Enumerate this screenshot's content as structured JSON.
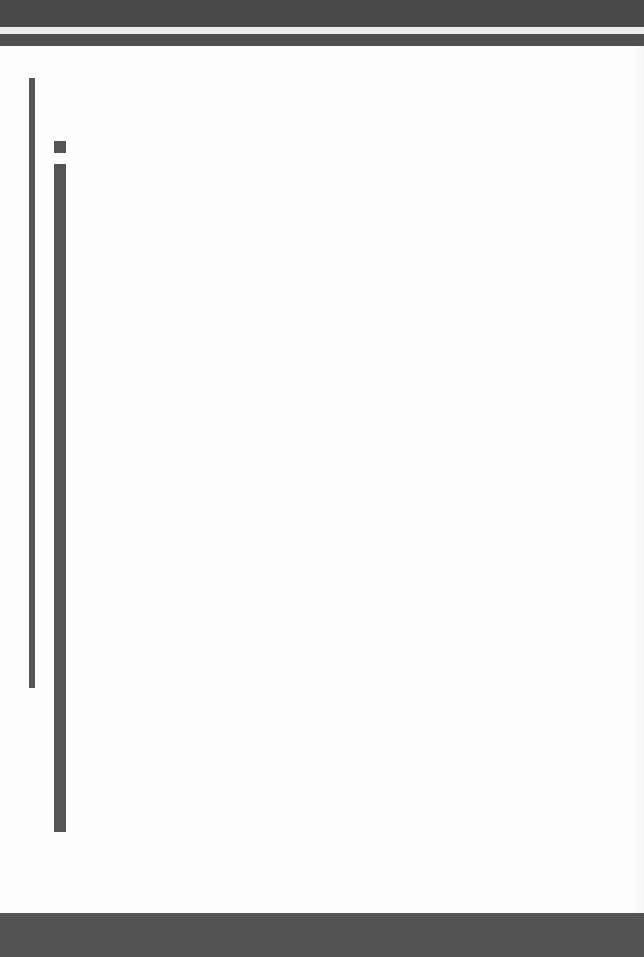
{
  "page": {
    "type": "scanned-blank-page",
    "colors": {
      "background": "#fdfdfd",
      "band": "#4a4a4a",
      "rule": "#555555"
    },
    "text": ""
  }
}
